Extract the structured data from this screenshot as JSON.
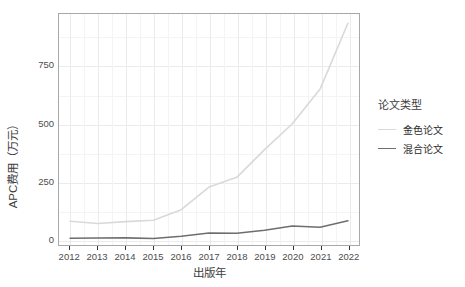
{
  "chart_data": {
    "type": "line",
    "title": "",
    "xlabel": "出版年",
    "ylabel": "APC费用（万元）",
    "x": [
      2012,
      2013,
      2014,
      2015,
      2016,
      2017,
      2018,
      2019,
      2020,
      2021,
      2022
    ],
    "xtick_labels": [
      "2012",
      "2013",
      "2014",
      "2015",
      "2016",
      "2017",
      "2018",
      "2019",
      "2020",
      "2021",
      "2022"
    ],
    "ytick_labels": [
      "0",
      "250",
      "500",
      "750"
    ],
    "ytick_values": [
      0,
      250,
      500,
      750
    ],
    "xlim": [
      2011.6,
      2022.4
    ],
    "ylim": [
      -25,
      975
    ],
    "grid": true,
    "legend_position": "right",
    "legend_title": "论文类型",
    "series": [
      {
        "name": "金色论文",
        "color": "#d9d9d9",
        "values": [
          78,
          68,
          76,
          82,
          128,
          226,
          268,
          388,
          500,
          650,
          935
        ]
      },
      {
        "name": "混合论文",
        "color": "#6e6e6e",
        "values": [
          4,
          5,
          6,
          3,
          13,
          27,
          26,
          39,
          57,
          52,
          80
        ]
      }
    ]
  },
  "axes": {
    "y_title": "APC费用（万元）",
    "x_title": "出版年",
    "y_ticks": [
      "0",
      "250",
      "500",
      "750"
    ],
    "x_ticks": [
      "2012",
      "2013",
      "2014",
      "2015",
      "2016",
      "2017",
      "2018",
      "2019",
      "2020",
      "2021",
      "2022"
    ]
  },
  "legend": {
    "title": "论文类型",
    "items": [
      {
        "label": "金色论文",
        "color": "#d9d9d9"
      },
      {
        "label": "混合论文",
        "color": "#6e6e6e"
      }
    ]
  },
  "colors": {
    "panel_background": "#ffffff",
    "panel_border": "#a8a8a8",
    "grid_major": "#ebebeb",
    "grid_minor": "#f4f4f4",
    "text": "#4d4d4d",
    "gold_series": "#d9d9d9",
    "hybrid_series": "#6e6e6e"
  }
}
